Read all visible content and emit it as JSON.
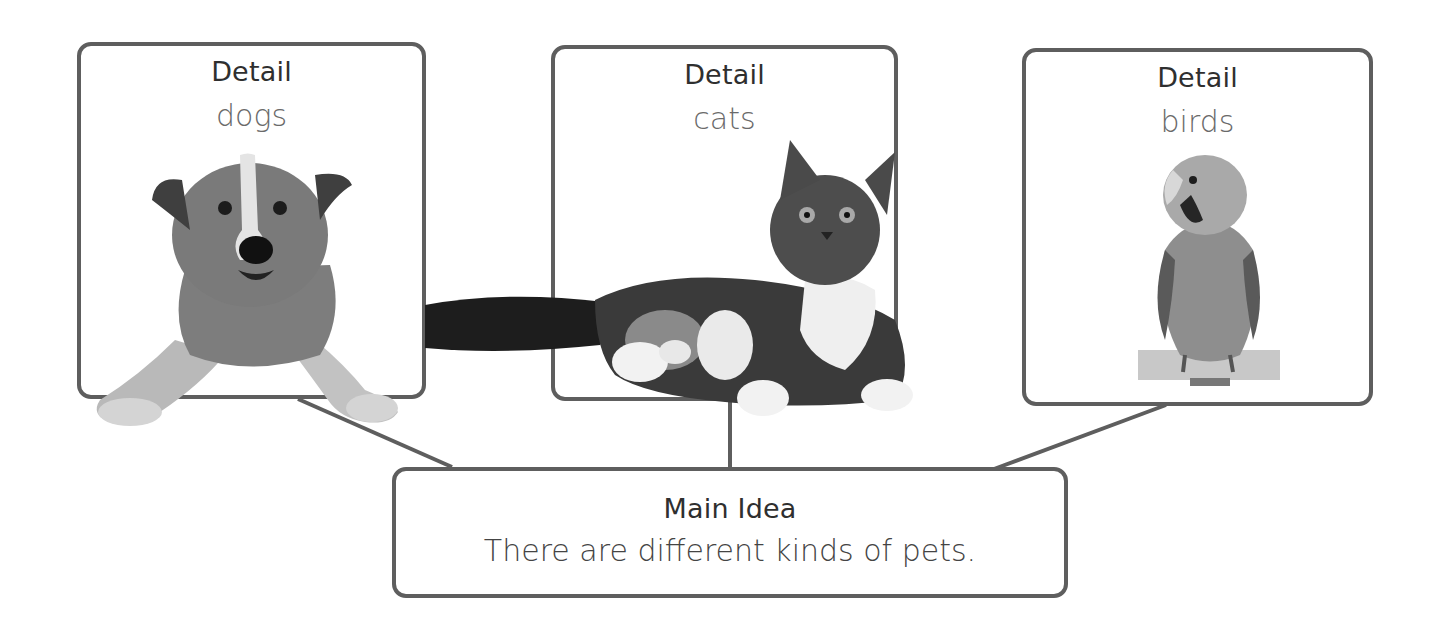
{
  "diagram": {
    "type": "main-idea-and-details graphic organizer",
    "details": [
      {
        "heading": "Detail",
        "text": "dogs",
        "image": "dog-photo"
      },
      {
        "heading": "Detail",
        "text": "cats",
        "image": "cat-photo"
      },
      {
        "heading": "Detail",
        "text": "birds",
        "image": "bird-photo"
      }
    ],
    "main_idea": {
      "heading": "Main Idea",
      "text": "There are different kinds of pets."
    },
    "colors": {
      "border": "#5e5e5e",
      "heading_text": "#2f2f2f",
      "detail_text": "#6a6a6a",
      "background": "#ffffff"
    }
  }
}
